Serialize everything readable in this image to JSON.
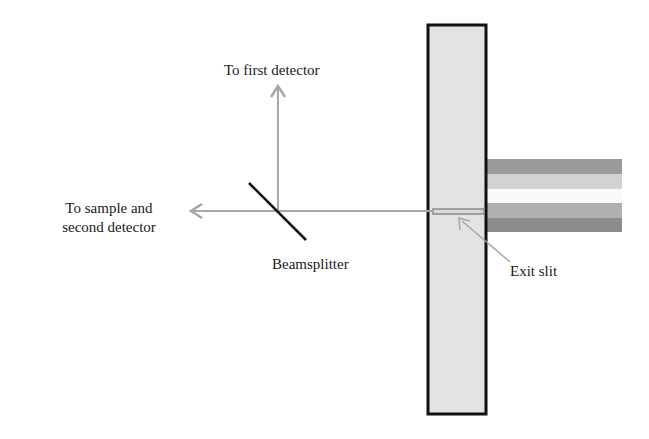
{
  "diagram": {
    "type": "optical-setup",
    "labels": {
      "first_detector": "To first detector",
      "sample_line1": "To sample and",
      "sample_line2": "second detector",
      "beamsplitter": "Beamsplitter",
      "exit_slit": "Exit slit"
    },
    "components": {
      "panel": {
        "x": 427,
        "y": 24,
        "width": 60,
        "height": 391,
        "fill": "#e3e3e3",
        "stroke": "#111111"
      },
      "stripes": [
        {
          "name": "stripe-1",
          "y": 159,
          "height": 15,
          "color": "#9a9a9a"
        },
        {
          "name": "stripe-2",
          "y": 174,
          "height": 15,
          "color": "#d2d2d2"
        },
        {
          "name": "stripe-3",
          "y": 189,
          "height": 14,
          "color": "#fafafa"
        },
        {
          "name": "stripe-4",
          "y": 203,
          "height": 15,
          "color": "#b0b0b0"
        },
        {
          "name": "stripe-5",
          "y": 218,
          "height": 14,
          "color": "#8c8c8c"
        }
      ],
      "beam_color": "#a6a6a6",
      "beamsplitter_color": "#111111",
      "slit_color": "#b5b5b5"
    }
  }
}
